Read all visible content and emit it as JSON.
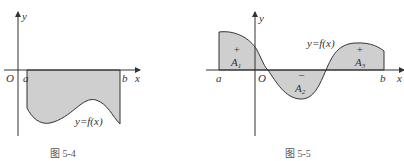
{
  "fig1": {
    "caption": "图 5-4",
    "origin": "O",
    "x_axis": "x",
    "y_axis": "y",
    "a": "a",
    "b": "b",
    "curve_label": "y=f(x)"
  },
  "fig2": {
    "caption": "图 5-5",
    "origin": "O",
    "x_axis": "x",
    "y_axis": "y",
    "a": "a",
    "b": "b",
    "curve_label": "y=f(x)",
    "regions": [
      {
        "sign": "+",
        "name": "A",
        "sub": "1"
      },
      {
        "sign": "−",
        "name": "A",
        "sub": "2"
      },
      {
        "sign": "+",
        "name": "A",
        "sub": "3"
      }
    ]
  },
  "colors": {
    "fill": "#cfcfcf",
    "stroke": "#333333"
  }
}
